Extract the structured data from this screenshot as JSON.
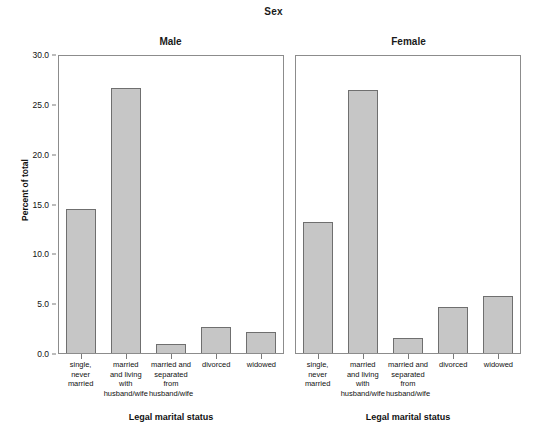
{
  "chart_data": {
    "type": "bar",
    "title": "Sex",
    "xlabel": "Legal marital status",
    "ylabel": "Percent of total",
    "ylim": [
      0,
      30
    ],
    "yticks": [
      0.0,
      5.0,
      10.0,
      15.0,
      20.0,
      25.0,
      30.0
    ],
    "ytick_labels": [
      "0.0",
      "5.0",
      "10.0",
      "15.0",
      "20.0",
      "25.0",
      "30.0"
    ],
    "grid": false,
    "legend": "none",
    "categories": [
      "single, never married",
      "married and living with husband/wife",
      "married and separated from husband/wife",
      "divorced",
      "widowed"
    ],
    "category_lines": [
      [
        "single,",
        "never",
        "married"
      ],
      [
        "married",
        "and living",
        "with",
        "husband/wife"
      ],
      [
        "married and",
        "separated",
        "from",
        "husband/wife"
      ],
      [
        "divorced"
      ],
      [
        "widowed"
      ]
    ],
    "panels": [
      {
        "label": "Male",
        "values": [
          14.4,
          26.6,
          0.9,
          2.6,
          2.1
        ]
      },
      {
        "label": "Female",
        "values": [
          13.1,
          26.4,
          1.5,
          4.6,
          5.7
        ]
      }
    ],
    "series": [
      {
        "name": "Male",
        "values": [
          14.4,
          26.6,
          0.9,
          2.6,
          2.1
        ]
      },
      {
        "name": "Female",
        "values": [
          13.1,
          26.4,
          1.5,
          4.6,
          5.7
        ]
      }
    ],
    "colors": {
      "bar_fill": "#c6c6c6",
      "bar_border": "#6f6f6f",
      "panel_border": "#8c8c8c",
      "text": "#111111",
      "background": "#ffffff"
    }
  }
}
